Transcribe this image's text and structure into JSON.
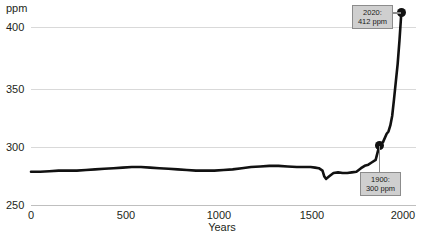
{
  "chart_data": {
    "type": "line",
    "title": "",
    "xlabel": "Years",
    "ylabel": "ppm",
    "y_unit_label": "ppm",
    "xlim": [
      0,
      2100
    ],
    "ylim": [
      250,
      415
    ],
    "xticks": [
      "0",
      "500",
      "1000",
      "1500",
      "2000"
    ],
    "xtick_values": [
      0,
      500,
      1000,
      1500,
      2000
    ],
    "yticks": [
      "250",
      "300",
      "350",
      "400"
    ],
    "ytick_values": [
      250,
      300,
      350,
      400
    ],
    "grid": "horizontal",
    "legend": "none",
    "series": [
      {
        "name": "Atmospheric CO2",
        "color": "#111111",
        "x": [
          0,
          50,
          100,
          150,
          200,
          250,
          300,
          350,
          400,
          450,
          500,
          550,
          600,
          650,
          700,
          750,
          800,
          850,
          900,
          950,
          1000,
          1050,
          1100,
          1150,
          1200,
          1250,
          1300,
          1350,
          1400,
          1450,
          1500,
          1525,
          1550,
          1570,
          1590,
          1600,
          1610,
          1625,
          1650,
          1675,
          1700,
          1725,
          1750,
          1775,
          1800,
          1820,
          1840,
          1860,
          1880,
          1900,
          1920,
          1940,
          1950,
          1960,
          1970,
          1980,
          1990,
          2000,
          2010,
          2020
        ],
        "y": [
          278,
          278,
          278.5,
          279,
          279,
          279,
          279.5,
          280,
          280.5,
          281,
          281.5,
          282,
          282,
          281.5,
          281,
          280.5,
          280,
          279.5,
          279,
          279,
          279,
          279.5,
          280,
          281,
          282,
          282.5,
          283,
          283,
          282.5,
          282,
          282,
          282,
          281.5,
          281,
          279,
          274,
          272,
          274,
          277,
          277.5,
          277,
          277,
          277.5,
          278,
          281,
          283,
          284,
          286,
          288,
          300,
          303,
          310,
          312,
          317,
          325,
          339,
          354,
          369,
          389,
          412
        ]
      }
    ],
    "annotations": [
      {
        "id": "anno-2020",
        "line1": "2020:",
        "line2": "412 ppm",
        "point_x": 2020,
        "point_y": 412,
        "marker": true
      },
      {
        "id": "anno-1900",
        "line1": "1900:",
        "line2": "300 ppm",
        "point_x": 1900,
        "point_y": 300,
        "marker": true
      }
    ],
    "colors": {
      "line": "#111111",
      "grid": "#d9d9d9",
      "axis": "#bfbfbf",
      "annotation_fill": "#cfcfcf",
      "annotation_border": "#8c8c8c",
      "text": "#231f20",
      "background": "#ffffff"
    }
  },
  "axis": {
    "y_unit": "ppm",
    "y_tick_400": "400",
    "y_tick_350": "350",
    "y_tick_300": "300",
    "y_tick_250": "250",
    "x_tick_0": "0",
    "x_tick_500": "500",
    "x_tick_1000": "1000",
    "x_tick_1500": "1500",
    "x_tick_2000": "2000",
    "x_title": "Years"
  },
  "annotations": {
    "top": {
      "line1": "2020:",
      "line2": "412 ppm"
    },
    "bottom": {
      "line1": "1900:",
      "line2": "300 ppm"
    }
  }
}
